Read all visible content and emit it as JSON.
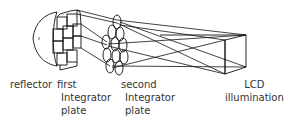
{
  "diagram": {
    "line_color": "#111111",
    "labels": {
      "reflector": {
        "line1": "reflector"
      },
      "first_plate": {
        "line1": "first",
        "line2": "Integrator",
        "line3": "plate"
      },
      "second_plate": {
        "line1": "second",
        "line2": "Integrator",
        "line3": "plate"
      },
      "lcd": {
        "line1": "LCD",
        "line2": "illumination"
      }
    }
  }
}
